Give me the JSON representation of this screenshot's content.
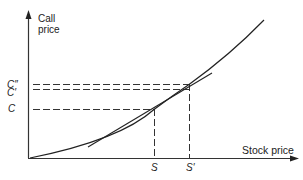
{
  "diagram": {
    "y_axis_label_line1": "Call",
    "y_axis_label_line2": "price",
    "x_axis_label": "Stock price",
    "y_ticks": {
      "c_double_prime": "C″",
      "c_prime": "C′",
      "c": "C"
    },
    "x_ticks": {
      "s": "S",
      "s_prime": "S′"
    },
    "colors": {
      "line": "#222222",
      "background": "#ffffff"
    },
    "elements": [
      "convex call price curve vs stock price",
      "tangent line at S",
      "dashed guide lines from C, C', C'' to curve/tangent",
      "dashed verticals at S and S'"
    ]
  }
}
